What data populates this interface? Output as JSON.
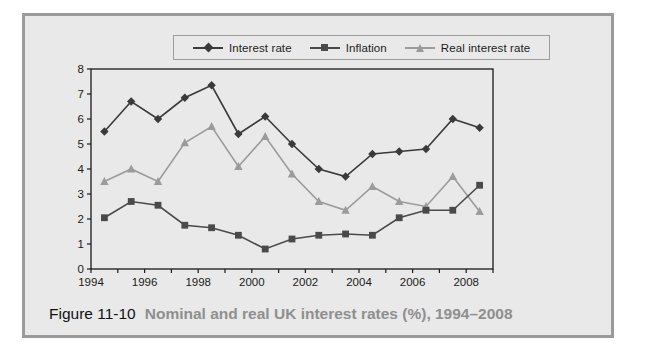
{
  "caption": {
    "number": "Figure 11-10",
    "title": "Nominal and real UK interest rates (%), 1994–2008"
  },
  "colors": {
    "interest_rate": "#3a3a3a",
    "inflation": "#4a4a4a",
    "real_interest_rate": "#9b9b9b",
    "plot_background": "#e9e9e9",
    "card_background": "#e8e8e8",
    "frame_border": "#9a9a9a",
    "axis": "#1a1a1a",
    "caption_number": "#111111",
    "caption_title": "#8f8f8f"
  },
  "legend": {
    "items": [
      {
        "label": "Interest rate",
        "marker": "diamond-marker",
        "color": "#3a3a3a"
      },
      {
        "label": "Inflation",
        "marker": "square-marker",
        "color": "#4a4a4a"
      },
      {
        "label": "Real interest rate",
        "marker": "triangle-marker",
        "color": "#9b9b9b"
      }
    ]
  },
  "chart_data": {
    "type": "line",
    "title": "Nominal and real UK interest rates (%), 1994–2008",
    "xlabel": "",
    "ylabel": "",
    "x": [
      1994,
      1995,
      1996,
      1997,
      1998,
      1999,
      2000,
      2001,
      2002,
      2003,
      2004,
      2005,
      2006,
      2007,
      2008
    ],
    "x_tick_labels": [
      "1994",
      "1996",
      "1998",
      "2000",
      "2002",
      "2004",
      "2006",
      "2008"
    ],
    "x_tick_values": [
      1994,
      1996,
      1998,
      2000,
      2002,
      2004,
      2006,
      2008
    ],
    "xlim": [
      1994,
      2009
    ],
    "y_tick_labels": [
      "0",
      "1",
      "2",
      "3",
      "4",
      "5",
      "6",
      "7",
      "8"
    ],
    "y_tick_values": [
      0,
      1,
      2,
      3,
      4,
      5,
      6,
      7,
      8
    ],
    "ylim": [
      0,
      8
    ],
    "grid": false,
    "legend_position": "top",
    "series": [
      {
        "name": "Interest rate",
        "marker": "diamond",
        "color": "#3a3a3a",
        "values": [
          5.5,
          6.7,
          6.0,
          6.85,
          7.35,
          5.4,
          6.1,
          5.0,
          4.0,
          3.7,
          4.6,
          4.7,
          4.8,
          6.0,
          5.65
        ]
      },
      {
        "name": "Inflation",
        "marker": "square",
        "color": "#4a4a4a",
        "values": [
          2.05,
          2.7,
          2.55,
          1.75,
          1.65,
          1.35,
          0.8,
          1.2,
          1.35,
          1.4,
          1.35,
          2.05,
          2.35,
          2.35,
          3.35
        ]
      },
      {
        "name": "Real interest rate",
        "marker": "triangle",
        "color": "#9b9b9b",
        "values": [
          3.5,
          4.0,
          3.5,
          5.05,
          5.7,
          4.1,
          5.3,
          3.8,
          2.7,
          2.35,
          3.3,
          2.7,
          2.5,
          3.7,
          2.3
        ]
      }
    ]
  }
}
